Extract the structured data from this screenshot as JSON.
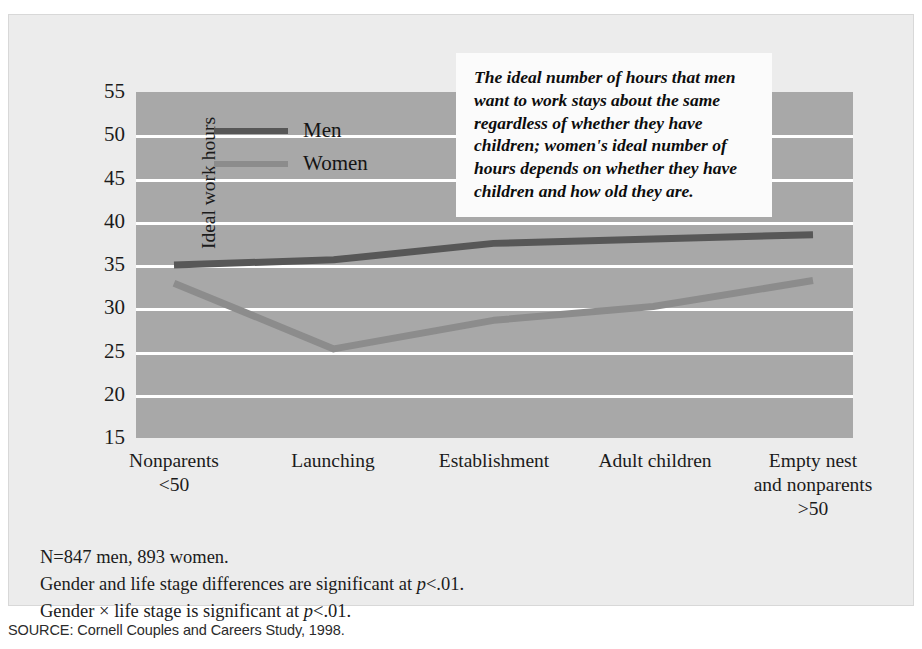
{
  "chart_data": {
    "type": "line",
    "title": "",
    "xlabel": "",
    "ylabel": "Ideal work hours",
    "ylim": [
      15,
      55
    ],
    "ytick_step": 5,
    "yticks": [
      55,
      50,
      45,
      40,
      35,
      30,
      25,
      20,
      15
    ],
    "gridlines": [
      50,
      45,
      40,
      35,
      30,
      25,
      20
    ],
    "grid": true,
    "legend_position": "upper-left-inside",
    "categories": [
      "Nonparents\n<50",
      "Launching",
      "Establishment",
      "Adult children",
      "Empty nest\nand nonparents\n>50"
    ],
    "series": [
      {
        "name": "Men",
        "values": [
          35.0,
          35.6,
          37.5,
          38.0,
          38.5
        ],
        "color": "#575757"
      },
      {
        "name": "Women",
        "values": [
          32.9,
          25.3,
          28.6,
          30.2,
          33.2
        ],
        "color": "#8c8c8c"
      }
    ],
    "annotation": "The ideal number of hours that men want to work stays about the same regardless of whether they have children; women's ideal number of hours depends on whether they have children and how old they are.",
    "plot_background": "#a8a8a8",
    "gridline_color": "#ffffff"
  },
  "axis": {
    "y_title": "Ideal work hours",
    "y_ticks": [
      "55",
      "50",
      "45",
      "40",
      "35",
      "30",
      "25",
      "20",
      "15"
    ],
    "x_ticks": [
      {
        "line1": "Nonparents",
        "line2": "<50",
        "line3": ""
      },
      {
        "line1": "Launching",
        "line2": "",
        "line3": ""
      },
      {
        "line1": "Establishment",
        "line2": "",
        "line3": ""
      },
      {
        "line1": "Adult children",
        "line2": "",
        "line3": ""
      },
      {
        "line1": "Empty nest",
        "line2": "and nonparents",
        "line3": ">50"
      }
    ]
  },
  "legend": {
    "items": [
      {
        "label": "Men",
        "color": "#575757"
      },
      {
        "label": "Women",
        "color": "#8c8c8c"
      }
    ]
  },
  "callout": {
    "text": "The ideal number of hours that men want to work stays about the same regardless of whether they have children; women's ideal number of hours depends on whether they have children and how old they are."
  },
  "footnotes": {
    "line1": "N=847 men, 893 women.",
    "line2_a": "Gender and life stage differences are significant at ",
    "line2_p": "p",
    "line2_b": "<.01.",
    "line3_a": "Gender × life stage is significant at ",
    "line3_p": "p",
    "line3_b": "<.01."
  },
  "source": {
    "text": "SOURCE: Cornell Couples and Careers Study, 1998."
  }
}
